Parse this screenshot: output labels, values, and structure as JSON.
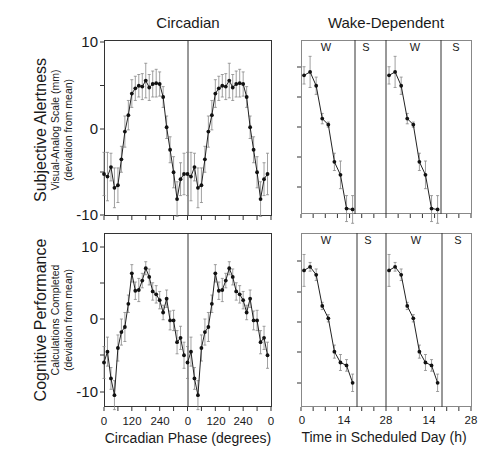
{
  "column_titles": {
    "left": "Circadian",
    "right": "Wake-Dependent"
  },
  "rows": [
    {
      "label_main": "Subjective Alertness",
      "label_sub1": "Visual-Analog Scale (mm)",
      "label_sub2": "(deviation from mean)"
    },
    {
      "label_main": "Cognitive Performance",
      "label_sub1": "Calculations Completed",
      "label_sub2": "(deviation from mean)"
    }
  ],
  "y_ticks": {
    "top": [
      "10",
      "0",
      "-10"
    ],
    "bottom": [
      "10",
      "0",
      "-10"
    ]
  },
  "x_axis": {
    "left_title": "Circadian Phase (degrees)",
    "left_ticks": [
      "0",
      "120",
      "240",
      "0",
      "120",
      "240",
      "0"
    ],
    "right_title": "Time in Scheduled Day (h)",
    "right_ticks": [
      "0",
      "14",
      "28",
      "14",
      "28"
    ]
  },
  "ws_labels": {
    "wake": "W",
    "sleep": "S"
  },
  "chart_data": [
    {
      "type": "line",
      "title": "Circadian",
      "panel": "top-left",
      "xlabel": "Circadian Phase (degrees)",
      "ylabel": "Subjective Alertness — Visual-Analog Scale (mm) (deviation from mean)",
      "x": [
        0,
        15,
        30,
        45,
        60,
        75,
        90,
        105,
        120,
        135,
        150,
        165,
        180,
        195,
        210,
        225,
        240,
        255,
        270,
        285,
        300,
        315,
        330,
        345
      ],
      "values": [
        -5.2,
        -5.5,
        -4.4,
        -6.8,
        -6.5,
        -3.5,
        -0.3,
        1.6,
        4.1,
        4.7,
        5.0,
        4.9,
        5.6,
        4.8,
        5.2,
        5.3,
        5.2,
        3.7,
        0.2,
        -2.4,
        -5.0,
        -8.1,
        -5.8,
        -5.2
      ],
      "error": [
        2.5,
        2.8,
        1.6,
        2.3,
        2.0,
        1.5,
        1.8,
        1.7,
        1.6,
        1.4,
        1.3,
        1.5,
        2.0,
        1.5,
        1.5,
        1.6,
        1.4,
        1.2,
        1.3,
        1.5,
        1.8,
        2.0,
        1.9,
        2.4
      ],
      "note": "Data double-plotted (two 360° cycles)",
      "ylim": [
        -10,
        10
      ],
      "xlim": [
        0,
        720
      ],
      "grid": false
    },
    {
      "type": "line",
      "title": "Wake-Dependent",
      "panel": "top-right",
      "xlabel": "Time in Scheduled Day (h)",
      "ylabel": "Subjective Alertness (deviation from mean)",
      "x": [
        1,
        3,
        5,
        7,
        9,
        11,
        13,
        15,
        17
      ],
      "values": [
        6.2,
        6.6,
        5.0,
        1.2,
        0.5,
        -3.8,
        -5.3,
        -9.2,
        -9.3
      ],
      "error": [
        1.0,
        1.8,
        1.0,
        0.6,
        0.3,
        1.0,
        1.6,
        1.5,
        1.6
      ],
      "annotations": [
        "W (wake, 0–18 h)",
        "S (sleep, 18–28 h)"
      ],
      "note": "Data double-plotted (two 28-h days)",
      "ylim": [
        -10,
        10
      ],
      "xlim": [
        0,
        56
      ]
    },
    {
      "type": "line",
      "title": "Circadian",
      "panel": "bottom-left",
      "xlabel": "Circadian Phase (degrees)",
      "ylabel": "Cognitive Performance — Calculations Completed (deviation from mean)",
      "x": [
        0,
        15,
        30,
        45,
        60,
        75,
        90,
        105,
        120,
        135,
        150,
        165,
        180,
        195,
        210,
        225,
        240,
        255,
        270,
        285,
        300,
        315,
        330,
        345
      ],
      "values": [
        -6.0,
        -4.5,
        -8.2,
        -10.5,
        -4.0,
        -1.8,
        -1.1,
        2.1,
        6.3,
        3.9,
        4.0,
        5.3,
        7.0,
        5.8,
        3.8,
        3.4,
        2.6,
        0.9,
        2.8,
        -0.2,
        -0.2,
        -3.2,
        -2.6,
        -5.0
      ],
      "error": [
        2.2,
        2.0,
        1.5,
        2.0,
        1.8,
        1.8,
        2.0,
        1.2,
        1.2,
        1.2,
        1.6,
        1.0,
        0.9,
        1.1,
        1.2,
        1.2,
        1.2,
        1.0,
        1.2,
        1.3,
        1.4,
        1.6,
        1.6,
        1.8
      ],
      "note": "Data double-plotted (two 360° cycles)",
      "ylim": [
        -12,
        12
      ],
      "xlim": [
        0,
        720
      ]
    },
    {
      "type": "line",
      "title": "Wake-Dependent",
      "panel": "bottom-right",
      "xlabel": "Time in Scheduled Day (h)",
      "ylabel": "Cognitive Performance (deviation from mean)",
      "x": [
        1,
        3,
        5,
        7,
        9,
        11,
        13,
        15,
        17
      ],
      "values": [
        6.7,
        7.2,
        6.1,
        1.8,
        0.1,
        -4.5,
        -6.0,
        -6.4,
        -8.8
      ],
      "error": [
        2.2,
        0.6,
        0.8,
        0.5,
        0.5,
        0.9,
        1.1,
        0.8,
        1.2
      ],
      "annotations": [
        "W (wake, 0–18 h)",
        "S (sleep, 18–28 h)"
      ],
      "note": "Data double-plotted (two 28-h days)",
      "ylim": [
        -12,
        12
      ],
      "xlim": [
        0,
        56
      ]
    }
  ]
}
